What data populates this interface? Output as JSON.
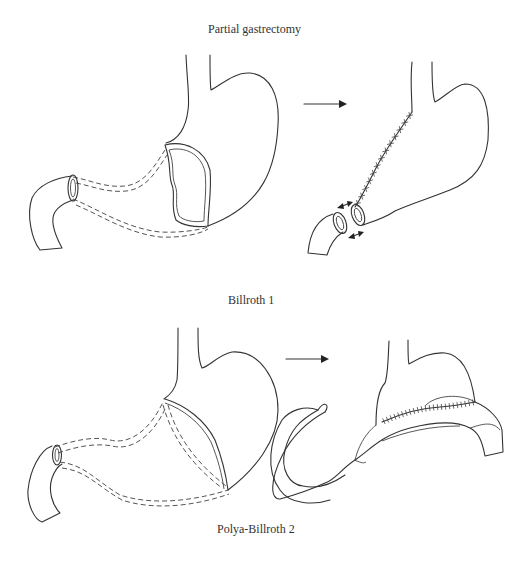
{
  "figure": {
    "panels": [
      {
        "id": "partial-gastrectomy",
        "caption": "Partial gastrectomy"
      },
      {
        "id": "billroth-1",
        "caption": "Billroth 1"
      },
      {
        "id": "polya-billroth-2",
        "caption": "Polya-Billroth 2"
      }
    ],
    "colors": {
      "line": "#333333",
      "background": "#ffffff"
    }
  }
}
